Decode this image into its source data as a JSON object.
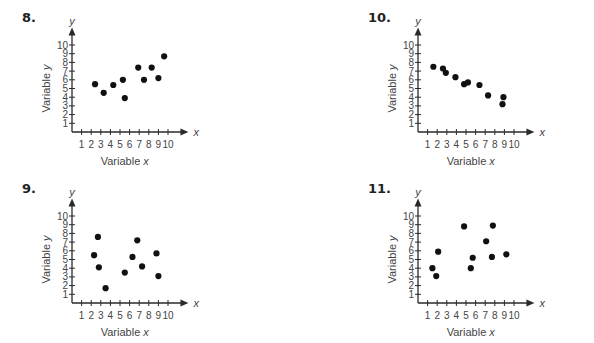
{
  "chart_data": [
    {
      "id": "8",
      "type": "scatter",
      "title": "8.",
      "xlabel": "Variable x",
      "ylabel": "Variable y",
      "x_axis_letter": "x",
      "y_axis_letter": "y",
      "xlim": [
        0,
        10
      ],
      "ylim": [
        0,
        10
      ],
      "xticks": [
        1,
        2,
        3,
        4,
        5,
        6,
        7,
        8,
        9,
        10
      ],
      "yticks": [
        1,
        2,
        3,
        4,
        5,
        6,
        7,
        8,
        9,
        10
      ],
      "grid": false,
      "points": [
        [
          2.4,
          5.5
        ],
        [
          3.3,
          4.5
        ],
        [
          4.3,
          5.4
        ],
        [
          5.3,
          6.0
        ],
        [
          5.5,
          3.9
        ],
        [
          6.9,
          7.4
        ],
        [
          7.5,
          6.0
        ],
        [
          8.3,
          7.4
        ],
        [
          9.0,
          6.2
        ],
        [
          9.6,
          8.7
        ]
      ]
    },
    {
      "id": "10",
      "type": "scatter",
      "title": "10.",
      "xlabel": "Variable x",
      "ylabel": "Variable y",
      "x_axis_letter": "x",
      "y_axis_letter": "y",
      "xlim": [
        0,
        10
      ],
      "ylim": [
        0,
        10
      ],
      "xticks": [
        1,
        2,
        3,
        4,
        5,
        6,
        7,
        8,
        9,
        10
      ],
      "yticks": [
        1,
        2,
        3,
        4,
        5,
        6,
        7,
        8,
        9,
        10
      ],
      "grid": false,
      "points": [
        [
          1.6,
          7.5
        ],
        [
          2.6,
          7.3
        ],
        [
          2.9,
          6.8
        ],
        [
          3.9,
          6.3
        ],
        [
          4.8,
          5.5
        ],
        [
          5.2,
          5.7
        ],
        [
          6.4,
          5.4
        ],
        [
          7.3,
          4.2
        ],
        [
          8.8,
          3.2
        ],
        [
          8.9,
          4.0
        ]
      ]
    },
    {
      "id": "9",
      "type": "scatter",
      "title": "9.",
      "xlabel": "Variable x",
      "ylabel": "Variable y",
      "x_axis_letter": "x",
      "y_axis_letter": "y",
      "xlim": [
        0,
        10
      ],
      "ylim": [
        0,
        10
      ],
      "xticks": [
        1,
        2,
        3,
        4,
        5,
        6,
        7,
        8,
        9,
        10
      ],
      "yticks": [
        1,
        2,
        3,
        4,
        5,
        6,
        7,
        8,
        9,
        10
      ],
      "grid": false,
      "points": [
        [
          2.3,
          5.5
        ],
        [
          2.7,
          7.6
        ],
        [
          2.8,
          4.1
        ],
        [
          3.5,
          1.7
        ],
        [
          5.5,
          3.5
        ],
        [
          6.3,
          5.3
        ],
        [
          6.8,
          7.2
        ],
        [
          7.3,
          4.2
        ],
        [
          8.8,
          5.7
        ],
        [
          9.0,
          3.1
        ]
      ]
    },
    {
      "id": "11",
      "type": "scatter",
      "title": "11.",
      "xlabel": "Variable x",
      "ylabel": "Variable y",
      "x_axis_letter": "x",
      "y_axis_letter": "y",
      "xlim": [
        0,
        10
      ],
      "ylim": [
        0,
        10
      ],
      "xticks": [
        1,
        2,
        3,
        4,
        5,
        6,
        7,
        8,
        9,
        10
      ],
      "yticks": [
        1,
        2,
        3,
        4,
        5,
        6,
        7,
        8,
        9,
        10
      ],
      "grid": false,
      "points": [
        [
          1.5,
          4.0
        ],
        [
          1.9,
          3.1
        ],
        [
          2.1,
          5.9
        ],
        [
          4.8,
          8.8
        ],
        [
          5.5,
          4.0
        ],
        [
          5.7,
          5.2
        ],
        [
          7.1,
          7.1
        ],
        [
          7.7,
          5.3
        ],
        [
          7.8,
          8.9
        ],
        [
          9.2,
          5.6
        ]
      ]
    }
  ],
  "panels": [
    {
      "label": "8.",
      "left": 22,
      "top": 12
    },
    {
      "label": "10.",
      "left": 368,
      "top": 12
    },
    {
      "label": "9.",
      "left": 22,
      "top": 183
    },
    {
      "label": "11.",
      "left": 368,
      "top": 183
    }
  ]
}
